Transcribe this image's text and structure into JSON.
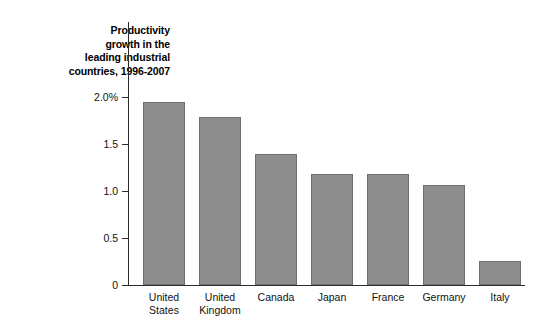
{
  "chart_data": {
    "type": "bar",
    "title": "Productivity\ngrowth in the\nleading industrial\ncountries, 1996-2007",
    "title_flat": "Productivity growth in the leading industrial countries, 1996-2007",
    "xlabel": "",
    "ylabel": "",
    "ylim": [
      0,
      2.0
    ],
    "grid": false,
    "legend": "none",
    "bar_color": "#8d8d8d",
    "bar_border_color": "#6f6f6f",
    "axis_color": "#2b2b2b",
    "background": "#ffffff",
    "categories": [
      "United\nStates",
      "United\nKingdom",
      "Canada",
      "Japan",
      "France",
      "Germany",
      "Italy"
    ],
    "categories_flat": [
      "United States",
      "United Kingdom",
      "Canada",
      "Japan",
      "France",
      "Germany",
      "Italy"
    ],
    "values": [
      1.95,
      1.79,
      1.39,
      1.18,
      1.18,
      1.06,
      0.26
    ],
    "yticks": [
      0,
      0.5,
      1.0,
      1.5,
      2.0
    ],
    "ytick_labels": [
      "0",
      "0.5",
      "1.0",
      "1.5",
      "2.0%"
    ],
    "units": "percent"
  }
}
